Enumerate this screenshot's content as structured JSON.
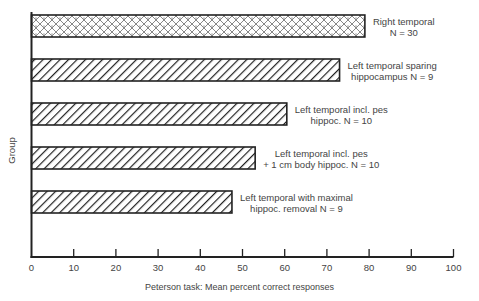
{
  "chart_data": {
    "type": "bar",
    "orientation": "horizontal",
    "title": "",
    "xlabel": "Peterson task:  Mean percent correct responses",
    "ylabel": "Group",
    "xlim": [
      0,
      100
    ],
    "xticks": [
      0,
      10,
      20,
      30,
      40,
      50,
      60,
      70,
      80,
      90,
      100
    ],
    "grid": false,
    "legend": "none (bars labeled directly)",
    "categories": [
      "Right temporal N = 30",
      "Left temporal sparing hippocampus N = 9",
      "Left temporal incl. pes hippoc. N = 10",
      "Left temporal incl. pes + 1 cm body hippoc. N = 10",
      "Left temporal with maximal hippoc. removal N = 9"
    ],
    "values": [
      79,
      73,
      60.5,
      53,
      47.5
    ],
    "bars": [
      {
        "label_line1": "Right temporal",
        "label_line2": "N = 30",
        "value": 79,
        "pattern": "crosshatch-dotted"
      },
      {
        "label_line1": "Left temporal sparing",
        "label_line2": "hippocampus N = 9",
        "value": 73,
        "pattern": "diagonal-hatch"
      },
      {
        "label_line1": "Left temporal incl. pes",
        "label_line2": "hippoc. N = 10",
        "value": 60.5,
        "pattern": "diagonal-hatch"
      },
      {
        "label_line1": "Left temporal incl. pes",
        "label_line2": "+ 1 cm body hippoc. N = 10",
        "value": 53,
        "pattern": "diagonal-hatch"
      },
      {
        "label_line1": "Left temporal with maximal",
        "label_line2": "hippoc. removal N = 9",
        "value": 47.5,
        "pattern": "diagonal-hatch"
      }
    ]
  }
}
